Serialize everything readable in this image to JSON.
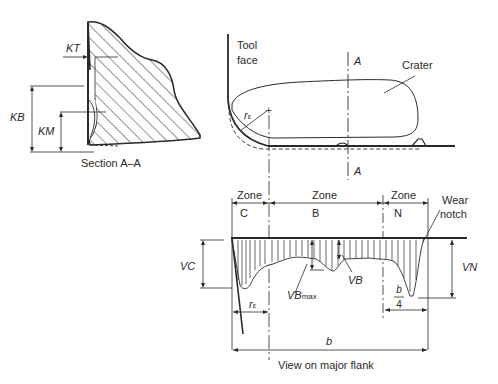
{
  "figure": {
    "section_view": {
      "caption": "Section A–A",
      "labels": {
        "kt": "KT",
        "kb": "KB",
        "km": "KM"
      }
    },
    "top_view": {
      "tool_face_line1": "Tool",
      "tool_face_line2": "face",
      "crater": "Crater",
      "section_mark_top": "A",
      "section_mark_bottom": "A",
      "corner_radius": "r",
      "corner_radius_sub": "ε"
    },
    "flank_view": {
      "zones": [
        {
          "title": "Zone",
          "letter": "C"
        },
        {
          "title": "Zone",
          "letter": "B"
        },
        {
          "title": "Zone",
          "letter": "N"
        }
      ],
      "wear_notch_line1": "Wear",
      "wear_notch_line2": "notch",
      "vc": "VC",
      "vn": "VN",
      "vb": "VB",
      "vb_max": "VB",
      "vb_max_sub": "max",
      "corner_radius": "r",
      "corner_radius_sub": "ε",
      "b_over_4_num": "b",
      "b_over_4_den": "4",
      "width_b": "b",
      "caption": "View on major flank"
    },
    "colors": {
      "ink": "#2a2a2a",
      "background": "#ffffff"
    }
  }
}
